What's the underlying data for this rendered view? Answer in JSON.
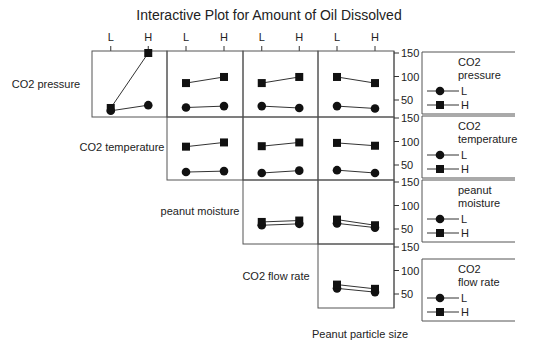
{
  "chart_data": {
    "type": "line",
    "title": "Interactive Plot for Amount of Oil Dissolved",
    "factors": [
      "CO2 pressure",
      "CO2 temperature",
      "peanut moisture",
      "CO2 flow rate",
      "Peanut particle size"
    ],
    "levels": [
      "L",
      "H"
    ],
    "ylim": [
      0,
      150
    ],
    "yticks": [
      50,
      100,
      150
    ],
    "grid": false,
    "legend_position": "right",
    "legends": [
      {
        "title_lines": [
          "CO2",
          "pressure"
        ],
        "entries": [
          {
            "marker": "circle",
            "label": "L"
          },
          {
            "marker": "square",
            "label": "H"
          }
        ]
      },
      {
        "title_lines": [
          "CO2",
          "temperature"
        ],
        "entries": [
          {
            "marker": "circle",
            "label": "L"
          },
          {
            "marker": "square",
            "label": "H"
          }
        ]
      },
      {
        "title_lines": [
          "peanut",
          "moisture"
        ],
        "entries": [
          {
            "marker": "circle",
            "label": "L"
          },
          {
            "marker": "square",
            "label": "H"
          }
        ]
      },
      {
        "title_lines": [
          "CO2",
          "flow rate"
        ],
        "entries": [
          {
            "marker": "circle",
            "label": "L"
          },
          {
            "marker": "square",
            "label": "H"
          }
        ]
      }
    ],
    "row_labels": [
      "CO2 pressure",
      "CO2 temperature",
      "peanut moisture",
      "CO2 flow rate"
    ],
    "column_top_ticks": [
      "L",
      "H"
    ],
    "bottom_label": "Peanut particle size",
    "panels": [
      {
        "row": 0,
        "col": 0,
        "row_factor": "CO2 pressure",
        "col_factor": "CO2 temperature",
        "series": [
          {
            "name": "L",
            "marker": "circle",
            "values": [
              27,
              39
            ]
          },
          {
            "name": "H",
            "marker": "square",
            "values": [
              33,
              150
            ]
          }
        ]
      },
      {
        "row": 0,
        "col": 1,
        "row_factor": "CO2 pressure",
        "col_factor": "peanut moisture",
        "series": [
          {
            "name": "L",
            "marker": "circle",
            "values": [
              34,
              37
            ]
          },
          {
            "name": "H",
            "marker": "square",
            "values": [
              86,
              99
            ]
          }
        ]
      },
      {
        "row": 0,
        "col": 2,
        "row_factor": "CO2 pressure",
        "col_factor": "CO2 flow rate",
        "series": [
          {
            "name": "L",
            "marker": "circle",
            "values": [
              37,
              33
            ]
          },
          {
            "name": "H",
            "marker": "square",
            "values": [
              86,
              99
            ]
          }
        ]
      },
      {
        "row": 0,
        "col": 3,
        "row_factor": "CO2 pressure",
        "col_factor": "Peanut particle size",
        "series": [
          {
            "name": "L",
            "marker": "circle",
            "values": [
              37,
              32
            ]
          },
          {
            "name": "H",
            "marker": "square",
            "values": [
              99,
              86
            ]
          }
        ]
      },
      {
        "row": 1,
        "col": 1,
        "row_factor": "CO2 temperature",
        "col_factor": "peanut moisture",
        "series": [
          {
            "name": "L",
            "marker": "circle",
            "values": [
              35,
              37
            ]
          },
          {
            "name": "H",
            "marker": "square",
            "values": [
              89,
              98
            ]
          }
        ]
      },
      {
        "row": 1,
        "col": 2,
        "row_factor": "CO2 temperature",
        "col_factor": "CO2 flow rate",
        "series": [
          {
            "name": "L",
            "marker": "circle",
            "values": [
              33,
              38
            ]
          },
          {
            "name": "H",
            "marker": "square",
            "values": [
              90,
              98
            ]
          }
        ]
      },
      {
        "row": 1,
        "col": 3,
        "row_factor": "CO2 temperature",
        "col_factor": "Peanut particle size",
        "series": [
          {
            "name": "L",
            "marker": "circle",
            "values": [
              39,
              33
            ]
          },
          {
            "name": "H",
            "marker": "square",
            "values": [
              97,
              91
            ]
          }
        ]
      },
      {
        "row": 2,
        "col": 2,
        "row_factor": "peanut moisture",
        "col_factor": "CO2 flow rate",
        "series": [
          {
            "name": "L",
            "marker": "circle",
            "values": [
              58,
              61
            ]
          },
          {
            "name": "H",
            "marker": "square",
            "values": [
              65,
              68
            ]
          }
        ]
      },
      {
        "row": 2,
        "col": 3,
        "row_factor": "peanut moisture",
        "col_factor": "Peanut particle size",
        "series": [
          {
            "name": "L",
            "marker": "circle",
            "values": [
              62,
              53
            ]
          },
          {
            "name": "H",
            "marker": "square",
            "values": [
              70,
              58
            ]
          }
        ]
      },
      {
        "row": 3,
        "col": 3,
        "row_factor": "CO2 flow rate",
        "col_factor": "Peanut particle size",
        "series": [
          {
            "name": "L",
            "marker": "circle",
            "values": [
              62,
              54
            ]
          },
          {
            "name": "H",
            "marker": "square",
            "values": [
              70,
              61
            ]
          }
        ]
      }
    ]
  }
}
